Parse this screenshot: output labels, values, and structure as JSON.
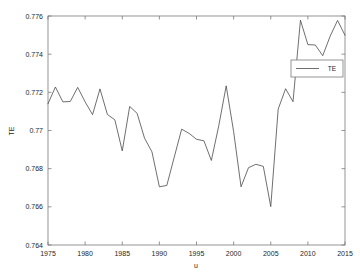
{
  "chart_data": {
    "type": "line",
    "title": "",
    "xlabel": "u",
    "ylabel": "TE",
    "xlim": [
      1975,
      2015
    ],
    "ylim": [
      0.764,
      0.776
    ],
    "grid": false,
    "legend_position": "upper right",
    "xticks": [
      1975,
      1980,
      1985,
      1990,
      1995,
      2000,
      2005,
      2010,
      2015
    ],
    "xtick_labels": [
      "1975",
      "1980",
      "1985",
      "1990",
      "1995",
      "2000",
      "2005",
      "2010",
      "2015"
    ],
    "yticks": [
      0.764,
      0.766,
      0.768,
      0.77,
      0.772,
      0.774,
      0.776
    ],
    "ytick_labels": [
      "0.764",
      "0.766",
      "0.768",
      "0.77",
      "0.772",
      "0.774",
      "0.776"
    ],
    "series": [
      {
        "name": "TE",
        "color": "#4a4a4a",
        "x": [
          1975,
          1976,
          1977,
          1978,
          1979,
          1980,
          1981,
          1982,
          1983,
          1984,
          1985,
          1986,
          1987,
          1988,
          1989,
          1990,
          1991,
          1992,
          1993,
          1994,
          1995,
          1996,
          1997,
          1998,
          1999,
          2000,
          2001,
          2002,
          2003,
          2004,
          2005,
          2006,
          2007,
          2008,
          2009,
          2010,
          2011,
          2012,
          2013,
          2014,
          2015
        ],
        "values": [
          0.7714,
          0.77228,
          0.7715,
          0.77152,
          0.77226,
          0.7715,
          0.77083,
          0.77218,
          0.77084,
          0.77056,
          0.76893,
          0.77126,
          0.7709,
          0.7696,
          0.76888,
          0.76705,
          0.76712,
          0.7686,
          0.77007,
          0.76985,
          0.76954,
          0.76946,
          0.76843,
          0.77025,
          0.77234,
          0.76994,
          0.76705,
          0.76805,
          0.76823,
          0.76812,
          0.76601,
          0.77112,
          0.77219,
          0.77151,
          0.77578,
          0.7745,
          0.77448,
          0.77392,
          0.77494,
          0.77577,
          0.77499
        ]
      }
    ]
  },
  "legend": {
    "entries": [
      {
        "label": "TE"
      }
    ]
  },
  "axes": {
    "x_title": "u",
    "y_title": "TE"
  }
}
